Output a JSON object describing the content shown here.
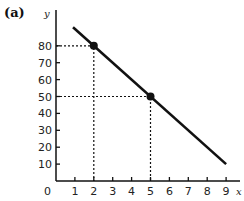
{
  "chart_data": {
    "type": "line",
    "panel_label": "(a)",
    "title": "",
    "xlabel": "x",
    "ylabel": "y",
    "origin_label": "0",
    "x_ticks": [
      1,
      2,
      3,
      4,
      5,
      6,
      7,
      8,
      9
    ],
    "y_ticks": [
      10,
      20,
      30,
      40,
      50,
      60,
      70,
      80
    ],
    "xlim": [
      0,
      9.8
    ],
    "ylim": [
      0,
      100
    ],
    "grid": false,
    "series": [
      {
        "name": "line",
        "x": [
          0.9,
          9
        ],
        "y": [
          91,
          10
        ],
        "color": "#111111"
      }
    ],
    "highlighted_points": [
      {
        "x": 2,
        "y": 80
      },
      {
        "x": 5,
        "y": 50
      }
    ],
    "dashed_guides": true
  }
}
